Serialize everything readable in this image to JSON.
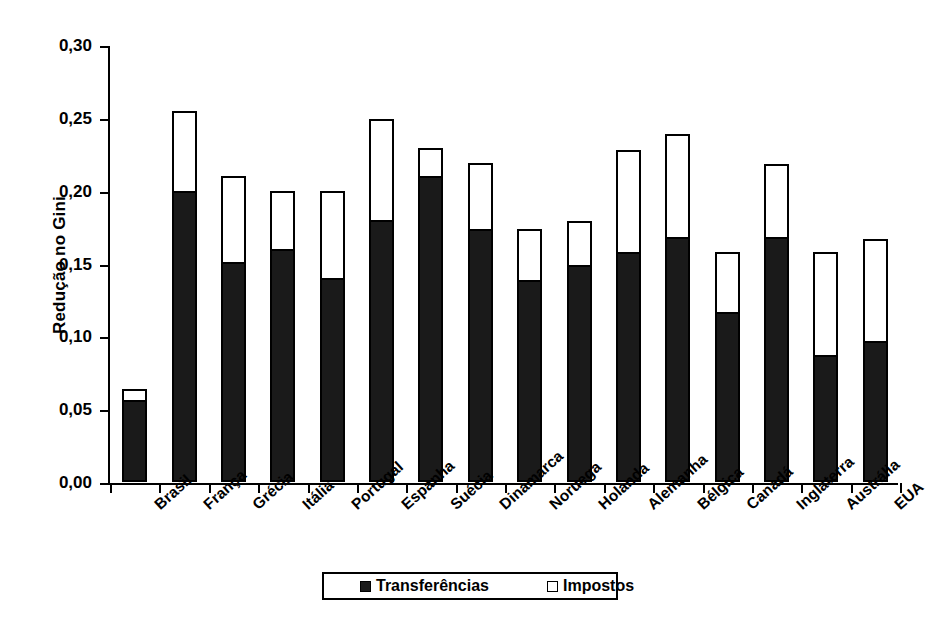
{
  "chart_data": {
    "type": "bar",
    "stacked": true,
    "title": "",
    "xlabel": "",
    "ylabel": "Redução no Gini",
    "ylim": [
      0.0,
      0.3
    ],
    "ytick_step": 0.05,
    "grid": false,
    "legend_position": "bottom",
    "decimal_separator": ",",
    "categories": [
      "Brasil",
      "França",
      "Grécia",
      "Itália",
      "Portugal",
      "Espanha",
      "Suécia",
      "Dinamarca",
      "Noruega",
      "Holanda",
      "Alemanha",
      "Bélgica",
      "Canadá",
      "Inglaterra",
      "Austrália",
      "EUA"
    ],
    "ytick_labels": [
      "0,00",
      "0,05",
      "0,10",
      "0,15",
      "0,20",
      "0,25",
      "0,30"
    ],
    "ytick_values": [
      0.0,
      0.05,
      0.1,
      0.15,
      0.2,
      0.25,
      0.3
    ],
    "series": [
      {
        "name": "Transferências",
        "style": "filled",
        "color": "#1a1a1a",
        "values": [
          0.056,
          0.2,
          0.151,
          0.16,
          0.14,
          0.18,
          0.21,
          0.174,
          0.139,
          0.149,
          0.158,
          0.168,
          0.117,
          0.168,
          0.087,
          0.097
        ]
      },
      {
        "name": "Impostos",
        "style": "hollow",
        "color": "#ffffff",
        "values": [
          0.008,
          0.055,
          0.059,
          0.04,
          0.06,
          0.069,
          0.019,
          0.045,
          0.035,
          0.03,
          0.07,
          0.071,
          0.041,
          0.05,
          0.071,
          0.07
        ]
      }
    ],
    "totals": [
      0.064,
      0.255,
      0.21,
      0.2,
      0.2,
      0.249,
      0.229,
      0.219,
      0.174,
      0.179,
      0.228,
      0.239,
      0.158,
      0.218,
      0.158,
      0.167
    ]
  },
  "legend": {
    "entries": [
      {
        "label": "Transferências",
        "style": "filled"
      },
      {
        "label": "Impostos",
        "style": "hollow"
      }
    ]
  }
}
